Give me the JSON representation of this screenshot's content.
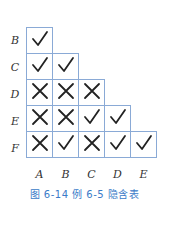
{
  "row_labels": [
    "B",
    "C",
    "D",
    "E",
    "F"
  ],
  "col_labels": [
    "A",
    "B",
    "C",
    "D",
    "E"
  ],
  "cells": [
    [
      "check"
    ],
    [
      "check",
      "check"
    ],
    [
      "cross-annotated",
      "cross-annotated",
      "cross-annotated"
    ],
    [
      "cross-annotated",
      "cross",
      "check",
      "check"
    ],
    [
      "cross-annotated",
      "check",
      "cross",
      "check",
      "check"
    ]
  ],
  "caption": "图 6-14   例 6-5 隐含表",
  "colors": {
    "grid_line": "#8aaad6",
    "caption": "#3a7bc8",
    "mark": "#222222"
  }
}
